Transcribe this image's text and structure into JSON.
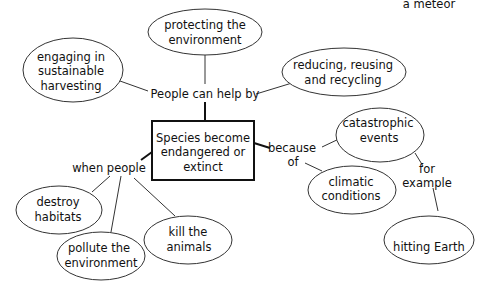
{
  "diagram": {
    "type": "concept-map",
    "central": {
      "line1": "Species become",
      "line2": "endangered or",
      "line3": "extinct"
    },
    "linkers": {
      "help": "People can help by",
      "when": "when people",
      "because1": "because",
      "because2": "of",
      "for1": "for",
      "for2": "example"
    },
    "nodes": {
      "protecting": {
        "line1": "protecting the",
        "line2": "environment"
      },
      "engaging": {
        "line1": "engaging in",
        "line2": "sustainable",
        "line3": "harvesting"
      },
      "reducing": {
        "line1": "reducing, reusing",
        "line2": "and recycling"
      },
      "catastrophic": {
        "line1": "catastrophic",
        "line2": "events"
      },
      "climatic": {
        "line1": "climatic",
        "line2": "conditions"
      },
      "meteor": {
        "line1": "a meteor",
        "line2": "hitting Earth"
      },
      "destroy": {
        "line1": "destroy",
        "line2": "habitats"
      },
      "pollute": {
        "line1": "pollute the",
        "line2": "environment"
      },
      "kill": {
        "line1": "kill the",
        "line2": "animals"
      }
    }
  }
}
